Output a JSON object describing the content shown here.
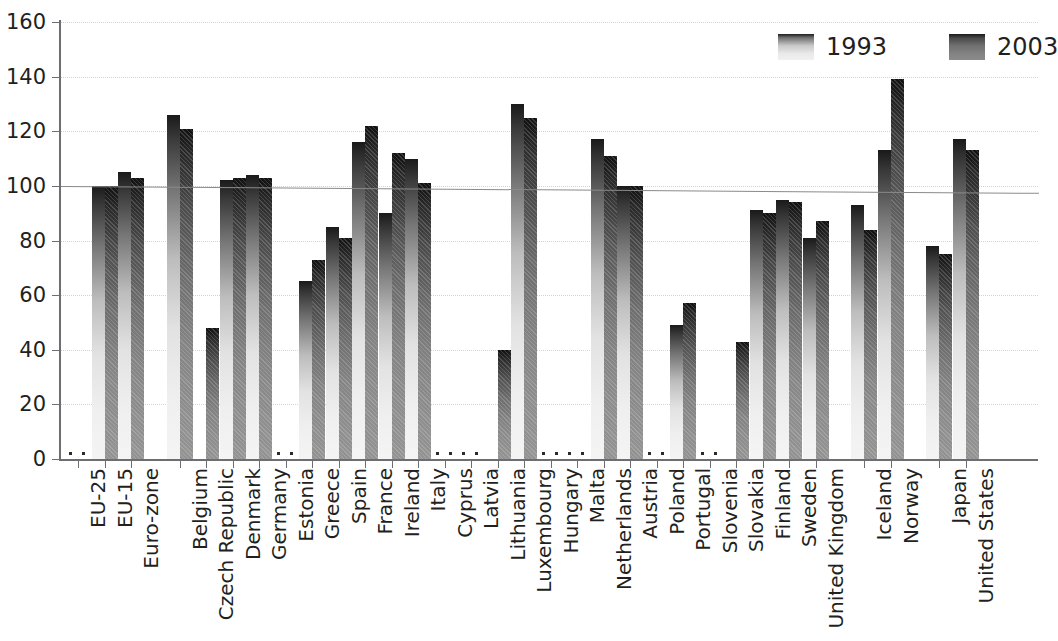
{
  "chart_data": {
    "type": "bar",
    "title": "",
    "xlabel": "",
    "ylabel": "",
    "ylim": [
      0,
      160
    ],
    "ytick_step": 20,
    "yticks": [
      "0",
      "20",
      "40",
      "60",
      "80",
      "100",
      "120",
      "140",
      "160"
    ],
    "grid": true,
    "legend_position": "top-right",
    "missing_marker": ":",
    "reference_line": {
      "label": "",
      "start_value": 100,
      "end_value": 97.5
    },
    "categories": [
      "EU-25",
      "EU-15",
      "Euro-zone",
      "Belgium",
      "Czech Republic",
      "Denmark",
      "Germany",
      "Estonia",
      "Greece",
      "Spain",
      "France",
      "Ireland",
      "Italy",
      "Cyprus",
      "Latvia",
      "Lithuania",
      "Luxembourg",
      "Hungary",
      "Malta",
      "Netherlands",
      "Austria",
      "Poland",
      "Portugal",
      "Slovenia",
      "Slovakia",
      "Finland",
      "Sweden",
      "United Kingdom",
      "Iceland",
      "Norway",
      "Japan",
      "United States"
    ],
    "group_gaps_after": [
      "Euro-zone",
      "United Kingdom",
      "Norway"
    ],
    "series": [
      {
        "name": "1993",
        "color": "#e2e2e2",
        "values": [
          null,
          100,
          105,
          126,
          null,
          102,
          104,
          null,
          65,
          85,
          116,
          90,
          110,
          null,
          null,
          null,
          130,
          null,
          null,
          117,
          100,
          null,
          49,
          null,
          null,
          91,
          95,
          81,
          93,
          113,
          78,
          117
        ]
      },
      {
        "name": "2003",
        "color": "#828282",
        "values": [
          null,
          100,
          103,
          121,
          48,
          103,
          103,
          null,
          73,
          81,
          122,
          112,
          101,
          null,
          null,
          40,
          125,
          null,
          null,
          111,
          100,
          null,
          57,
          null,
          43,
          90,
          94,
          87,
          84,
          139,
          75,
          113
        ]
      }
    ]
  },
  "legend": {
    "items": [
      {
        "label": "1993",
        "key": "y1993"
      },
      {
        "label": "2003",
        "key": "y2003"
      }
    ]
  }
}
